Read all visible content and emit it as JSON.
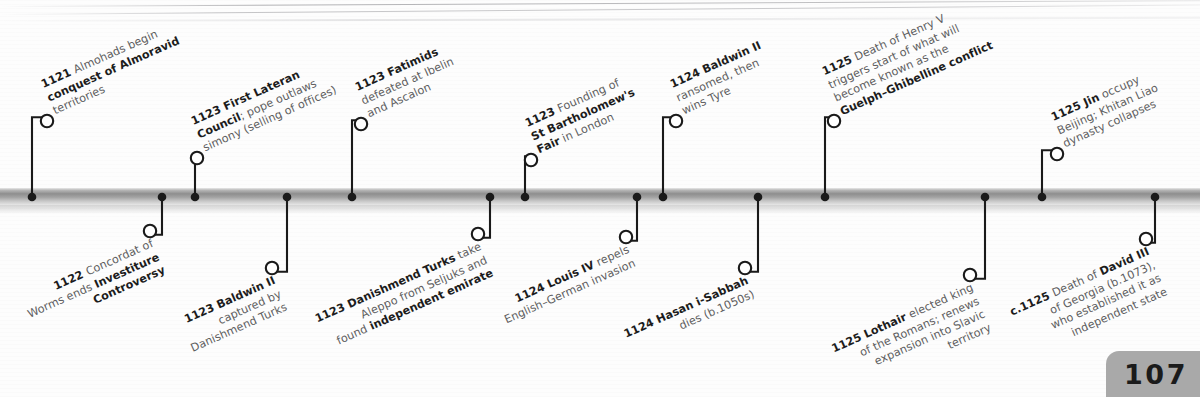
{
  "page": {
    "number": "107",
    "axis_color": "#8e8e8e",
    "accent_color": "#1c1c1c",
    "body_text_color": "#5d5d60"
  },
  "timeline": {
    "orientation": "horizontal",
    "year_range": "1121-1125",
    "events_above": [
      {
        "id": "almohads",
        "year": "1121",
        "lines": [
          [
            {
              "t": "1121 ",
              "b": true
            },
            {
              "t": "Almohads begin",
              "b": false
            }
          ],
          [
            {
              "t": "conquest of Almoravid",
              "b": true
            }
          ],
          [
            {
              "t": "territories",
              "b": false
            }
          ]
        ],
        "dot_x": 32,
        "circle_x": 47,
        "circle_y": 121
      },
      {
        "id": "first-lateran-council",
        "year": "1123",
        "lines": [
          [
            {
              "t": "1123 First Lateran",
              "b": true
            }
          ],
          [
            {
              "t": "Council",
              "b": true
            },
            {
              "t": "; pope outlaws",
              "b": false
            }
          ],
          [
            {
              "t": "simony (selling of offices)",
              "b": false
            }
          ]
        ],
        "dot_x": 195,
        "circle_x": 197,
        "circle_y": 158
      },
      {
        "id": "fatimids-ibelin-ascalon",
        "year": "1123",
        "lines": [
          [
            {
              "t": "1123 Fatimids",
              "b": true
            }
          ],
          [
            {
              "t": "defeated at Ibelin",
              "b": false
            }
          ],
          [
            {
              "t": "and Ascalon",
              "b": false
            }
          ]
        ],
        "dot_x": 352,
        "circle_x": 361,
        "circle_y": 124
      },
      {
        "id": "st-bartholomews-fair",
        "year": "1123",
        "lines": [
          [
            {
              "t": "1123 ",
              "b": true
            },
            {
              "t": "Founding of",
              "b": false
            }
          ],
          [
            {
              "t": "St Bartholomew's",
              "b": true
            }
          ],
          [
            {
              "t": "Fair",
              "b": true
            },
            {
              "t": " in London",
              "b": false
            }
          ]
        ],
        "dot_x": 525,
        "circle_x": 531,
        "circle_y": 160
      },
      {
        "id": "baldwin-ii-ransomed",
        "year": "1124",
        "lines": [
          [
            {
              "t": "1124 Baldwin II",
              "b": true
            }
          ],
          [
            {
              "t": "ransomed, then",
              "b": false
            }
          ],
          [
            {
              "t": "wins Tyre",
              "b": false
            }
          ]
        ],
        "dot_x": 663,
        "circle_x": 676,
        "circle_y": 121
      },
      {
        "id": "death-of-henry-v",
        "year": "1125",
        "lines": [
          [
            {
              "t": "1125 ",
              "b": true
            },
            {
              "t": "Death of Henry V",
              "b": false
            }
          ],
          [
            {
              "t": "triggers start of what will",
              "b": false
            }
          ],
          [
            {
              "t": "become known as the",
              "b": false
            }
          ],
          [
            {
              "t": "Guelph–Ghibelline conflict",
              "b": true
            }
          ]
        ],
        "dot_x": 825,
        "circle_x": 834,
        "circle_y": 121
      },
      {
        "id": "jin-occupy-beijing",
        "year": "1125",
        "lines": [
          [
            {
              "t": "1125 Jin",
              "b": true
            },
            {
              "t": " occupy",
              "b": false
            }
          ],
          [
            {
              "t": "Beijing; Khitan Liao",
              "b": false
            }
          ],
          [
            {
              "t": "dynasty collapses",
              "b": false
            }
          ]
        ],
        "dot_x": 1042,
        "circle_x": 1057,
        "circle_y": 154
      }
    ],
    "events_below": [
      {
        "id": "concordat-of-worms",
        "year": "1122",
        "lines": [
          [
            {
              "t": "1122 ",
              "b": true
            },
            {
              "t": "Concordat of",
              "b": false
            }
          ],
          [
            {
              "t": "Worms ends ",
              "b": false
            },
            {
              "t": "Investiture",
              "b": true
            }
          ],
          [
            {
              "t": "Controversy",
              "b": true
            }
          ]
        ],
        "dot_x": 162,
        "circle_x": 150,
        "circle_y": 231
      },
      {
        "id": "baldwin-ii-captured",
        "year": "1123",
        "lines": [
          [
            {
              "t": "1123 Baldwin II",
              "b": true
            }
          ],
          [
            {
              "t": "captured by",
              "b": false
            }
          ],
          [
            {
              "t": "Danishmend Turks",
              "b": false
            }
          ]
        ],
        "dot_x": 287,
        "circle_x": 272,
        "circle_y": 268
      },
      {
        "id": "danishmend-turks-aleppo",
        "year": "1123",
        "lines": [
          [
            {
              "t": "1123 Danishmend Turks",
              "b": true
            },
            {
              "t": " take",
              "b": false
            }
          ],
          [
            {
              "t": "Aleppo from Seljuks and",
              "b": false
            }
          ],
          [
            {
              "t": "found ",
              "b": false
            },
            {
              "t": "independent emirate",
              "b": true
            }
          ]
        ],
        "dot_x": 490,
        "circle_x": 478,
        "circle_y": 234
      },
      {
        "id": "louis-iv-repels-invasion",
        "year": "1124",
        "lines": [
          [
            {
              "t": "1124 Louis IV",
              "b": true
            },
            {
              "t": " repels",
              "b": false
            }
          ],
          [
            {
              "t": "English–German invasion",
              "b": false
            }
          ]
        ],
        "dot_x": 637,
        "circle_x": 626,
        "circle_y": 237
      },
      {
        "id": "hasan-i-sabbah-dies",
        "year": "1124",
        "lines": [
          [
            {
              "t": "1124 Hasan i-Sabbah",
              "b": true
            }
          ],
          [
            {
              "t": "dies (b.1050s)",
              "b": false
            }
          ]
        ],
        "dot_x": 758,
        "circle_x": 745,
        "circle_y": 268
      },
      {
        "id": "lothair-elected-king",
        "year": "1125",
        "lines": [
          [
            {
              "t": "1125 Lothair",
              "b": true
            },
            {
              "t": " elected king",
              "b": false
            }
          ],
          [
            {
              "t": "of the Romans; renews",
              "b": false
            }
          ],
          [
            {
              "t": "expansion into Slavic",
              "b": false
            }
          ],
          [
            {
              "t": "territory",
              "b": false
            }
          ]
        ],
        "dot_x": 985,
        "circle_x": 970,
        "circle_y": 275
      },
      {
        "id": "death-of-david-iii",
        "year": "c.1125",
        "lines": [
          [
            {
              "t": "c.1125 ",
              "b": true
            },
            {
              "t": "Death of ",
              "b": false
            },
            {
              "t": "David III",
              "b": true
            }
          ],
          [
            {
              "t": "of Georgia (b.1073),",
              "b": false
            }
          ],
          [
            {
              "t": "who established it as",
              "b": false
            }
          ],
          [
            {
              "t": "independent state",
              "b": false
            }
          ]
        ],
        "dot_x": 1155,
        "circle_x": 1146,
        "circle_y": 239
      }
    ]
  }
}
